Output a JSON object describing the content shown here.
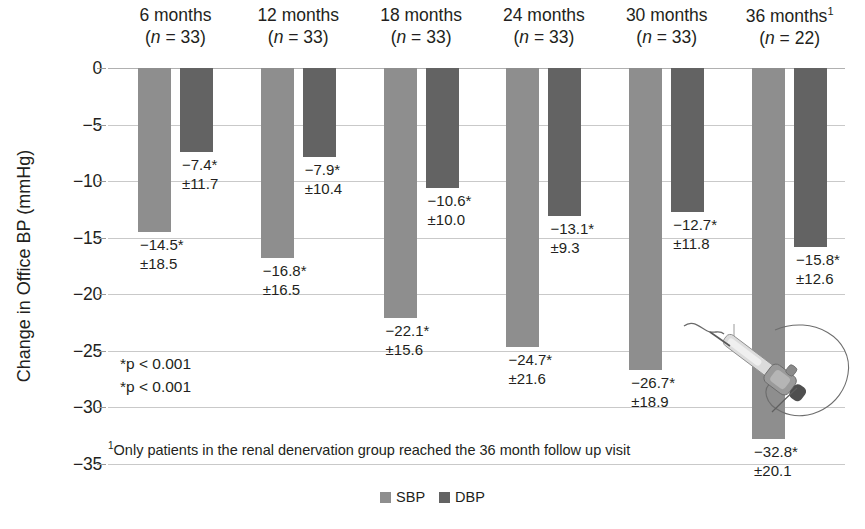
{
  "chart_data": {
    "type": "bar",
    "title": "",
    "xlabel": "",
    "ylabel": "Change in Office BP (mmHg)",
    "ylim": [
      -35,
      0
    ],
    "ytick_step": 5,
    "yticks": [
      "0",
      "−5",
      "−10",
      "−15",
      "−20",
      "−25",
      "−30",
      "−35"
    ],
    "ytick_values": [
      0,
      -5,
      -10,
      -15,
      -20,
      -25,
      -30,
      -35
    ],
    "grid": true,
    "legend_position": "bottom-center",
    "categories": [
      "6 months",
      "12 months",
      "18 months",
      "24 months",
      "30 months",
      "36 months"
    ],
    "group_headers": [
      {
        "label": "6 months",
        "superscript": "",
        "n_text": "(n = 33)",
        "n": 33
      },
      {
        "label": "12 months",
        "superscript": "",
        "n_text": "(n = 33)",
        "n": 33
      },
      {
        "label": "18 months",
        "superscript": "",
        "n_text": "(n = 33)",
        "n": 33
      },
      {
        "label": "24 months",
        "superscript": "",
        "n_text": "(n = 33)",
        "n": 33
      },
      {
        "label": "30 months",
        "superscript": "",
        "n_text": "(n = 33)",
        "n": 33
      },
      {
        "label": "36 months",
        "superscript": "1",
        "n_text": "(n = 22)",
        "n": 22
      }
    ],
    "series": [
      {
        "name": "SBP",
        "color": "#8e8e8e",
        "values": [
          -14.5,
          -16.8,
          -22.1,
          -24.7,
          -26.7,
          -32.8
        ],
        "sd": [
          18.5,
          16.5,
          15.6,
          21.6,
          18.9,
          20.1
        ],
        "labels": [
          {
            "value": "−14.5*",
            "sd": "±18.5"
          },
          {
            "value": "−16.8*",
            "sd": "±16.5"
          },
          {
            "value": "−22.1*",
            "sd": "±15.6"
          },
          {
            "value": "−24.7*",
            "sd": "±21.6"
          },
          {
            "value": "−26.7*",
            "sd": "±18.9"
          },
          {
            "value": "−32.8*",
            "sd": "±20.1"
          }
        ]
      },
      {
        "name": "DBP",
        "color": "#636363",
        "values": [
          -7.4,
          -7.9,
          -10.6,
          -13.1,
          -12.7,
          -15.8
        ],
        "sd": [
          11.7,
          10.4,
          10.0,
          9.3,
          11.8,
          12.6
        ],
        "labels": [
          {
            "value": "−7.4*",
            "sd": "±11.7"
          },
          {
            "value": "−7.9*",
            "sd": "±10.4"
          },
          {
            "value": "−10.6*",
            "sd": "±10.0"
          },
          {
            "value": "−13.1*",
            "sd": "±9.3"
          },
          {
            "value": "−12.7*",
            "sd": "±11.8"
          },
          {
            "value": "−15.8*",
            "sd": "±12.6"
          }
        ]
      }
    ],
    "annotations": [
      "*p < 0.001",
      "*p < 0.001"
    ],
    "footnote": {
      "marker": "1",
      "text": "Only patients in the renal denervation group reached the 36 month follow up visit"
    }
  },
  "legend": {
    "items": [
      {
        "label": "SBP",
        "color": "#8e8e8e"
      },
      {
        "label": "DBP",
        "color": "#636363"
      }
    ]
  },
  "colors": {
    "sbp": "#8e8e8e",
    "dbp": "#636363",
    "grid": "#c9c9c9",
    "text": "#231f20",
    "background": "#ffffff"
  },
  "device_illustration": {
    "name": "renal-denervation-catheter"
  }
}
